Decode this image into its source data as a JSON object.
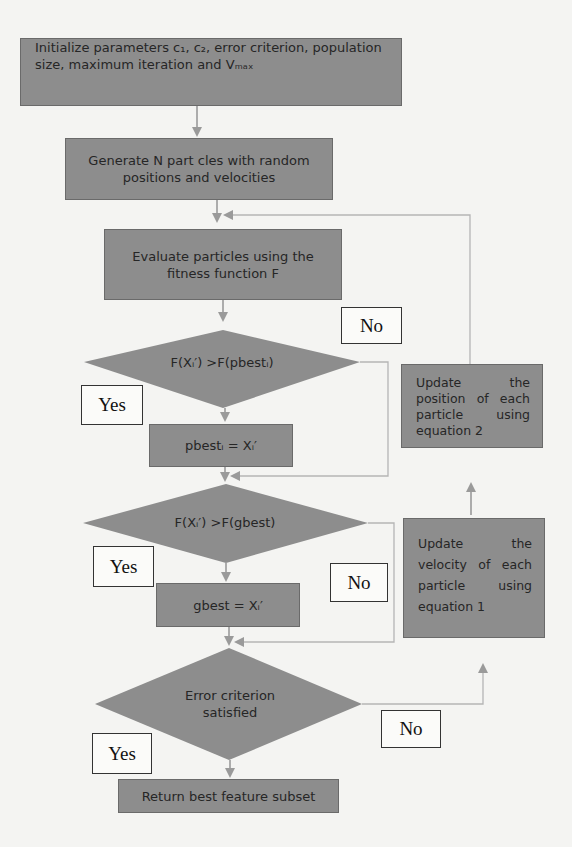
{
  "diagram": {
    "title": "",
    "nodes": {
      "init": {
        "type": "process",
        "line1": "Initialize parameters c₁, c₂, error criterion, population",
        "line2": "size, maximum iteration and Vₘₐₓ"
      },
      "generate": {
        "type": "process",
        "line1": "Generate N part cles with random",
        "line2": "positions and velocities"
      },
      "evaluate": {
        "type": "process",
        "line1": "Evaluate particles using the",
        "line2": "fitness function F"
      },
      "cond_pbest": {
        "type": "decision",
        "text": "F(Xᵢ′) >F(pbestᵢ)"
      },
      "assign_pbest": {
        "type": "process",
        "text": "pbestᵢ = Xᵢ′"
      },
      "cond_gbest": {
        "type": "decision",
        "text": "F(Xᵢ′) >F(gbest)"
      },
      "assign_gbest": {
        "type": "process",
        "text": "gbest = Xᵢ′"
      },
      "cond_error": {
        "type": "decision",
        "line1": "Error criterion",
        "line2": "satisfied"
      },
      "return": {
        "type": "terminal",
        "text": "Return best feature subset"
      },
      "update_position": {
        "type": "process",
        "text": "Update the position of each particle using equation 2"
      },
      "update_velocity": {
        "type": "process",
        "text": "Update the velocity of each particle using equation 1"
      }
    },
    "labels": {
      "yes_pbest": "Yes",
      "no_pbest": "No",
      "yes_gbest": "Yes",
      "no_gbest": "No",
      "yes_error": "Yes",
      "no_error": "No"
    },
    "edges": [
      {
        "from": "init",
        "to": "generate"
      },
      {
        "from": "generate",
        "to": "evaluate"
      },
      {
        "from": "evaluate",
        "to": "cond_pbest"
      },
      {
        "from": "cond_pbest",
        "to": "assign_pbest",
        "label": "Yes"
      },
      {
        "from": "cond_pbest",
        "to": "cond_gbest",
        "label": "No"
      },
      {
        "from": "assign_pbest",
        "to": "cond_gbest"
      },
      {
        "from": "cond_gbest",
        "to": "assign_gbest",
        "label": "Yes"
      },
      {
        "from": "cond_gbest",
        "to": "cond_error",
        "label": "No"
      },
      {
        "from": "assign_gbest",
        "to": "cond_error"
      },
      {
        "from": "cond_error",
        "to": "return",
        "label": "Yes"
      },
      {
        "from": "cond_error",
        "to": "update_velocity",
        "label": "No"
      },
      {
        "from": "update_velocity",
        "to": "update_position"
      },
      {
        "from": "update_position",
        "to": "evaluate"
      }
    ],
    "colors": {
      "node_fill": "#8d8d8d",
      "node_border": "#6a6a6a",
      "arrow": "#9a9a9a",
      "label_border": "#333333",
      "background": "#f4f4f2"
    }
  }
}
